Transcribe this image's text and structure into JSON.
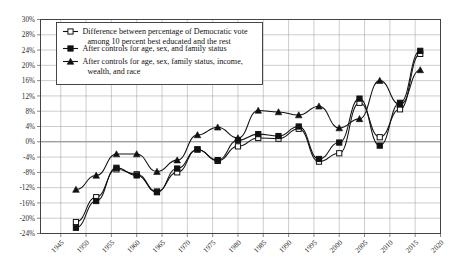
{
  "chart_data": {
    "type": "line",
    "title": "",
    "xlabel": "",
    "ylabel": "",
    "xlim": [
      1941,
      2020
    ],
    "ylim": [
      -24,
      30
    ],
    "ytick_labels": [
      "30%",
      "28%",
      "24%",
      "20%",
      "16%",
      "12%",
      "8%",
      "4%",
      "0%",
      "-4%",
      "-8%",
      "-12%",
      "-16%",
      "-20%",
      "-24%"
    ],
    "ytick_values": [
      30,
      28,
      24,
      20,
      16,
      12,
      8,
      4,
      0,
      -4,
      -8,
      -12,
      -16,
      -20,
      -24
    ],
    "xtick_labels": [
      "1945",
      "1950",
      "1955",
      "1960",
      "1965",
      "1970",
      "1975",
      "1980",
      "1985",
      "1990",
      "1995",
      "2000",
      "2005",
      "2010",
      "2015",
      "2020"
    ],
    "xtick_values": [
      1945,
      1950,
      1955,
      1960,
      1965,
      1970,
      1975,
      1980,
      1985,
      1990,
      1995,
      2000,
      2005,
      2010,
      2015,
      2020
    ],
    "grid": true,
    "legend_position": "top-left",
    "x": [
      1948,
      1952,
      1956,
      1960,
      1964,
      1968,
      1972,
      1976,
      1980,
      1984,
      1988,
      1992,
      1996,
      2000,
      2004,
      2008,
      2012,
      2016
    ],
    "series": [
      {
        "name": "Difference between percentage of Democratic vote among 10 percent best educated and the rest",
        "marker": "open-square",
        "values": [
          -21.0,
          -14.5,
          -7.2,
          -8.5,
          -13.0,
          -8.0,
          -2.0,
          -5.0,
          -1.2,
          1.0,
          0.8,
          3.4,
          -5.2,
          -3.0,
          10.2,
          1.2,
          8.5,
          23.0
        ]
      },
      {
        "name": "After controls for age, sex, and family status",
        "marker": "filled-square",
        "values": [
          -22.5,
          -15.5,
          -6.8,
          -8.8,
          -13.2,
          -7.0,
          -2.0,
          -4.8,
          0.4,
          2.0,
          1.5,
          4.0,
          -4.5,
          -0.2,
          11.3,
          -1.0,
          10.2,
          23.8
        ]
      },
      {
        "name": "After controls for age, sex, family status, income, wealth, and race",
        "marker": "filled-triangle",
        "values": [
          -12.5,
          -8.8,
          -3.2,
          -3.2,
          -7.8,
          -4.8,
          1.8,
          3.8,
          1.0,
          8.2,
          7.8,
          7.0,
          9.3,
          3.6,
          6.0,
          16.0,
          9.8,
          18.8
        ]
      }
    ]
  },
  "legend": {
    "entries": [
      {
        "marker": "open-square",
        "line1": "Difference between percentage of Democratic vote",
        "line2": "among 10 percent best educated and the rest"
      },
      {
        "marker": "filled-square",
        "line1": "After controls for age, sex, and family status",
        "line2": ""
      },
      {
        "marker": "filled-triangle",
        "line1": "After controls for age, sex, family status, income,",
        "line2": "wealth, and race"
      }
    ]
  },
  "colors": {
    "line": "#111111",
    "grid": "#9a9a9a",
    "frame": "#444444",
    "background": "#ffffff"
  }
}
